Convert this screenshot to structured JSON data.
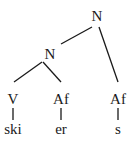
{
  "diagram": {
    "type": "syntax-tree",
    "nodes": [
      {
        "id": "n_root",
        "label": "N",
        "x": 97,
        "y": 21
      },
      {
        "id": "n_mid",
        "label": "N",
        "x": 50,
        "y": 59
      },
      {
        "id": "v",
        "label": "V",
        "x": 13,
        "y": 104
      },
      {
        "id": "af1",
        "label": "Af",
        "x": 61,
        "y": 104
      },
      {
        "id": "af2",
        "label": "Af",
        "x": 118,
        "y": 104
      }
    ],
    "leaves": [
      {
        "id": "w_ski",
        "label": "ski",
        "x": 13,
        "y": 134
      },
      {
        "id": "w_er",
        "label": "er",
        "x": 61,
        "y": 134
      },
      {
        "id": "w_s",
        "label": "s",
        "x": 118,
        "y": 134
      }
    ],
    "edges": [
      {
        "from": "n_root",
        "to": "n_mid"
      },
      {
        "from": "n_root",
        "to": "af2"
      },
      {
        "from": "n_mid",
        "to": "v"
      },
      {
        "from": "n_mid",
        "to": "af1"
      },
      {
        "from": "v",
        "to": "w_ski"
      },
      {
        "from": "af1",
        "to": "w_er"
      },
      {
        "from": "af2",
        "to": "w_s"
      }
    ]
  }
}
